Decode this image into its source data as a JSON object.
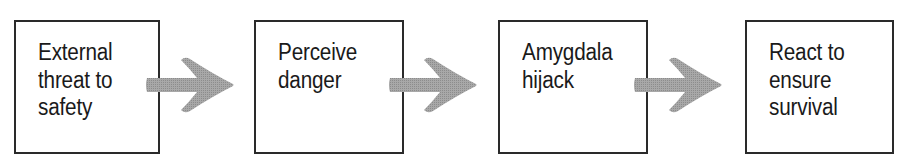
{
  "diagram": {
    "type": "flowchart",
    "direction": "left-to-right",
    "colors": {
      "box_border": "#2a2a2a",
      "text": "#1a1a1a",
      "arrow_fill": "#9a9a9a"
    },
    "steps": [
      {
        "label": "External\nthreat to\nsafety"
      },
      {
        "label": "Perceive\ndanger"
      },
      {
        "label": "Amygdala\nhijack"
      },
      {
        "label": "React to\nensure\nsurvival"
      }
    ],
    "connectors": [
      {
        "from": 0,
        "to": 1,
        "icon": "arrow-right-icon"
      },
      {
        "from": 1,
        "to": 2,
        "icon": "arrow-right-icon"
      },
      {
        "from": 2,
        "to": 3,
        "icon": "arrow-right-icon"
      }
    ]
  }
}
